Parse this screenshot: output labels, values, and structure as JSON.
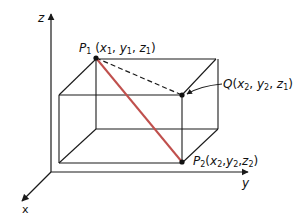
{
  "figure": {
    "axes": {
      "z_label": "z",
      "y_label": "y",
      "x_label": "x"
    },
    "points": {
      "P1": {
        "name": "P",
        "sub": "1",
        "coords": [
          {
            "v": "x",
            "s": "1"
          },
          {
            "v": "y",
            "s": "1"
          },
          {
            "v": "z",
            "s": "1"
          }
        ]
      },
      "Q": {
        "name": "Q",
        "sub": "",
        "coords": [
          {
            "v": "x",
            "s": "2"
          },
          {
            "v": "y",
            "s": "2"
          },
          {
            "v": "z",
            "s": "1"
          }
        ]
      },
      "P2": {
        "name": "P",
        "sub": "2",
        "coords": [
          {
            "v": "x",
            "s": "2"
          },
          {
            "v": "y",
            "s": "2"
          },
          {
            "v": "z",
            "s": "2"
          }
        ]
      }
    },
    "colors": {
      "edge": "#1a1a1a",
      "diagonal": "#c0504d"
    }
  }
}
